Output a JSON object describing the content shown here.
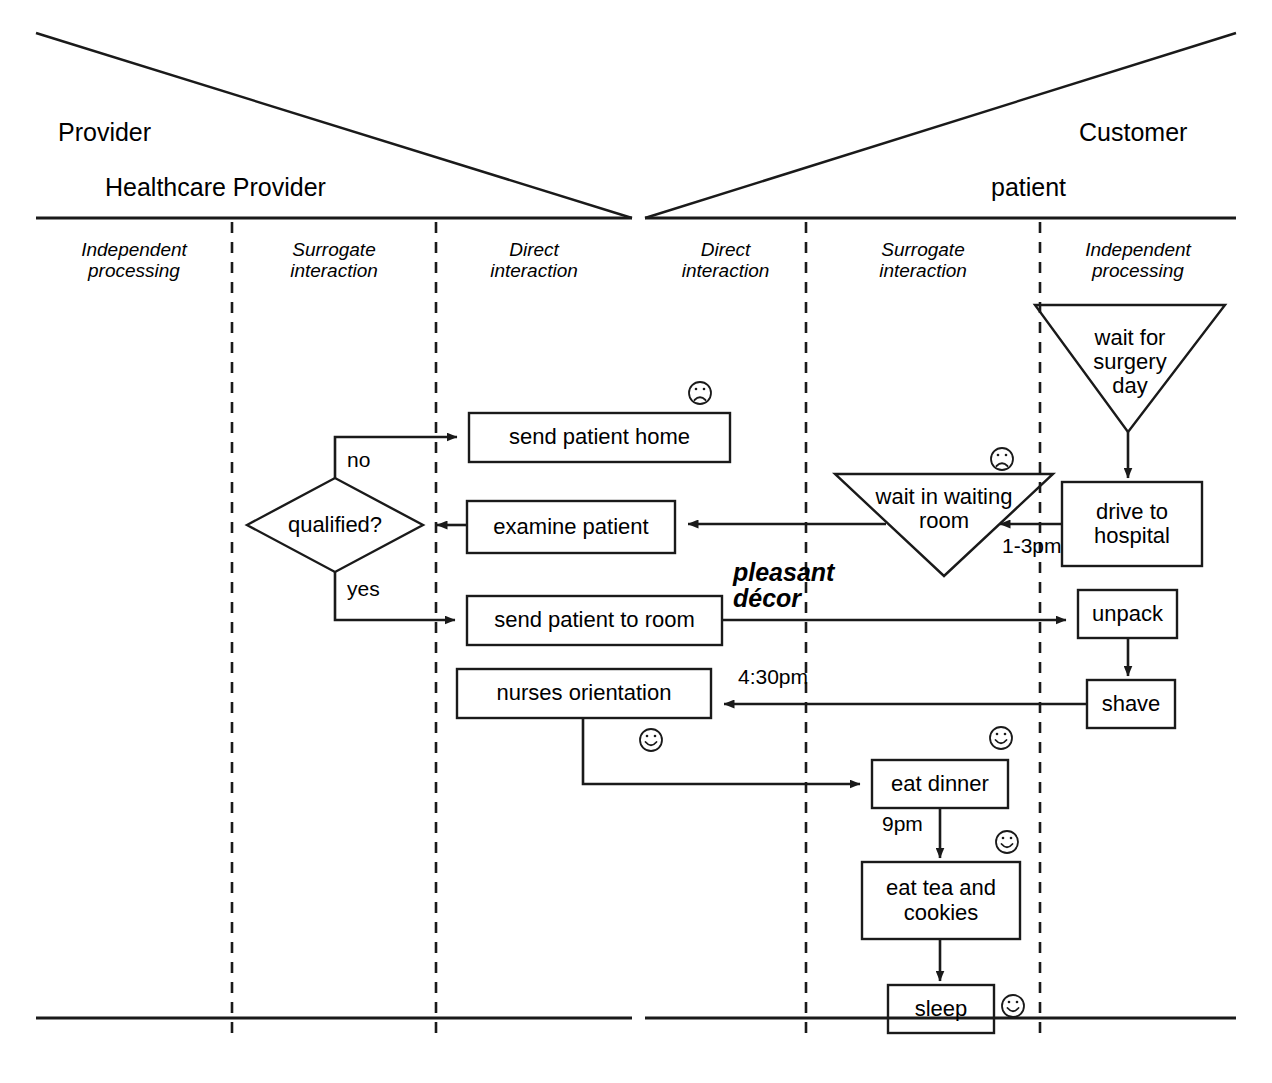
{
  "header": {
    "provider_role": "Provider",
    "provider_actor": "Healthcare Provider",
    "customer_role": "Customer",
    "customer_actor": "patient"
  },
  "zones": {
    "provider": [
      {
        "line1": "Independent",
        "line2": "processing"
      },
      {
        "line1": "Surrogate",
        "line2": "interaction"
      },
      {
        "line1": "Direct",
        "line2": "interaction"
      }
    ],
    "customer": [
      {
        "line1": "Direct",
        "line2": "interaction"
      },
      {
        "line1": "Surrogate",
        "line2": "interaction"
      },
      {
        "line1": "Independent",
        "line2": "processing"
      }
    ]
  },
  "nodes": {
    "wait_surgery_day": {
      "line1": "wait for",
      "line2": "surgery",
      "line3": "day"
    },
    "drive_to_hospital": {
      "line1": "drive to",
      "line2": "hospital"
    },
    "wait_in_waiting_room": {
      "line1": "wait in waiting",
      "line2": "room"
    },
    "send_patient_home": {
      "label": "send patient home"
    },
    "examine_patient": {
      "label": "examine patient"
    },
    "qualified": {
      "label": "qualified?"
    },
    "send_patient_to_room": {
      "label": "send patient to room"
    },
    "unpack": {
      "label": "unpack"
    },
    "shave": {
      "label": "shave"
    },
    "nurses_orientation": {
      "label": "nurses orientation"
    },
    "eat_dinner": {
      "label": "eat dinner"
    },
    "eat_tea_and_cookies": {
      "line1": "eat tea and",
      "line2": "cookies"
    },
    "sleep": {
      "label": "sleep"
    }
  },
  "edge_labels": {
    "no": "no",
    "yes": "yes",
    "one_to_three_pm": "1-3pm",
    "four_thirty_pm": "4:30pm",
    "nine_pm": "9pm"
  },
  "annotations": {
    "pleasant_decor_line1": "pleasant",
    "pleasant_decor_line2": "décor"
  },
  "emotions": [
    {
      "name": "frown-icon-send-patient-home",
      "type": "sad"
    },
    {
      "name": "frown-icon-wait-in-waiting-room",
      "type": "sad"
    },
    {
      "name": "smile-icon-nurses-orientation",
      "type": "happy"
    },
    {
      "name": "smile-icon-eat-dinner",
      "type": "happy"
    },
    {
      "name": "smile-icon-eat-tea-and-cookies",
      "type": "happy"
    },
    {
      "name": "smile-icon-sleep",
      "type": "happy"
    }
  ],
  "colors": {
    "stroke": "#1a1a1a",
    "background": "#ffffff",
    "text": "#000000"
  }
}
